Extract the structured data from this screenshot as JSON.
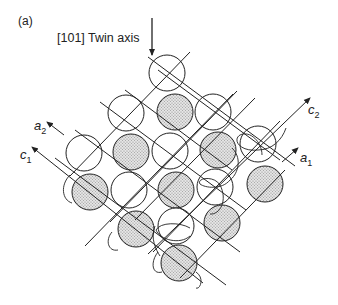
{
  "figure": {
    "panel_label": "(a)",
    "twin_axis_label": "[101] Twin axis",
    "axes": {
      "a1": {
        "base": "a",
        "sub": "1"
      },
      "a2": {
        "base": "a",
        "sub": "2"
      },
      "c1": {
        "base": "c",
        "sub": "1"
      },
      "c2": {
        "base": "c",
        "sub": "2"
      }
    },
    "colors": {
      "line": "#222222",
      "shaded_fill": "#c8c8c8",
      "open_fill": "#ffffff"
    },
    "atoms": [
      {
        "x": 167,
        "y": 73,
        "shaded": false
      },
      {
        "x": 126,
        "y": 113,
        "shaded": false
      },
      {
        "x": 175,
        "y": 112,
        "shaded": true
      },
      {
        "x": 213,
        "y": 112,
        "shaded": false
      },
      {
        "x": 84,
        "y": 153,
        "shaded": false
      },
      {
        "x": 131,
        "y": 152,
        "shaded": true
      },
      {
        "x": 170,
        "y": 151,
        "shaded": false
      },
      {
        "x": 218,
        "y": 150,
        "shaded": true
      },
      {
        "x": 258,
        "y": 144,
        "shaded": false
      },
      {
        "x": 90,
        "y": 192,
        "shaded": true
      },
      {
        "x": 129,
        "y": 190,
        "shaded": false
      },
      {
        "x": 176,
        "y": 190,
        "shaded": true
      },
      {
        "x": 215,
        "y": 187,
        "shaded": false
      },
      {
        "x": 265,
        "y": 184,
        "shaded": true
      },
      {
        "x": 136,
        "y": 229,
        "shaded": true
      },
      {
        "x": 176,
        "y": 226,
        "shaded": false
      },
      {
        "x": 222,
        "y": 223,
        "shaded": true
      },
      {
        "x": 179,
        "y": 263,
        "shaded": true
      }
    ],
    "atom_radius": 18
  }
}
